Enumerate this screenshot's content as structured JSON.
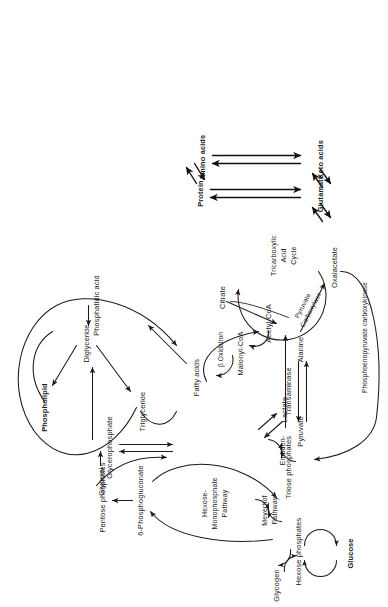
{
  "figure": {
    "domain": "diagram",
    "kind": "metabolic-pathway-map",
    "orientation": "rotated-90-ccw",
    "background_color": "#ffffff",
    "ink_color": "#1a1a1a"
  },
  "nodes": {
    "glucose": "Glucose",
    "glycogen": "Glycogen",
    "hexose_phosphates": "Hexose  phosphates",
    "six_phosphogluconate": "6-Phosphogluconate",
    "pentose_phosphates": "Pentose phosphates",
    "triose_phosphates": "Triose phosphates",
    "glycerol": "Glycerol",
    "glycerophosphate": "Glycerophosphate",
    "lactate": "Lactate",
    "pyruvate": "Pyruvate",
    "alanine": "Alanine",
    "oxalacetate": "Oxalacetate",
    "acetyl_coa": "Acetyl-CoA",
    "malonyl_coa": "Malonyl-CoA",
    "fatty_acids": "Fatty acids",
    "citrate": "Citrate",
    "phosphatidic_acid": "Phosphatidic acid",
    "diglyceride": "Diglyceride",
    "triglyceride": "Triglyceride",
    "phospholipid": "Phospholipid",
    "glutamate": "Glutamate",
    "keto_acids": "Keto acids",
    "protein": "Protein",
    "amino_acids": "Amino acids"
  },
  "cycle_labels": {
    "hexose_monophosphate_l1": "Hexose-",
    "hexose_monophosphate_l2": "Monophosphate",
    "hexose_monophosphate_l3": "Pathway",
    "embden": "Embden-",
    "meyerhof_l1": "Meyerhof",
    "meyerhof_l2": "Pathway",
    "tca_l1": "Tricarboxylic",
    "tca_l2": "Acid",
    "tca_l3": "Cycle"
  },
  "enzyme_labels": {
    "transaminase": "Transaminase",
    "pyruvate_carboxylase_l1": "Pyruvate",
    "pyruvate_carboxylase_l2": "Carboxylase",
    "pepck": "Phosphoenopyruvate carboxykinase",
    "beta_oxidation": "β Oxidation"
  },
  "bold_nodes": [
    "Glucose",
    "Phospholipid",
    "Amino acids",
    "Keto acids"
  ],
  "edges": [
    {
      "from": "Glucose",
      "to": "Hexose  phosphates",
      "type": "reversible-cycle"
    },
    {
      "from": "Hexose  phosphates",
      "to": "Glycogen",
      "type": "reversible-cycle"
    },
    {
      "from": "Hexose  phosphates",
      "to": "6-Phosphogluconate",
      "type": "arrow"
    },
    {
      "from": "6-Phosphogluconate",
      "to": "Pentose phosphates",
      "type": "arrow"
    },
    {
      "from": "Pentose phosphates",
      "to": "Triose phosphates",
      "type": "arrow"
    },
    {
      "from": "Hexose  phosphates",
      "to": "Triose phosphates",
      "type": "reversible-cycle"
    },
    {
      "from": "Triose phosphates",
      "to": "Glycerophosphate",
      "type": "double-arrow"
    },
    {
      "from": "Glycerol",
      "to": "Glycerophosphate",
      "type": "arrow"
    },
    {
      "from": "Glycerophosphate",
      "to": "Phosphatidic acid",
      "type": "arrow"
    },
    {
      "from": "Triose phosphates",
      "to": "Pyruvate",
      "type": "reversible-cycle"
    },
    {
      "from": "Lactate",
      "to": "Pyruvate",
      "type": "double-arrow"
    },
    {
      "from": "Alanine",
      "to": "Pyruvate",
      "type": "double-arrow",
      "enzyme": "Transaminase"
    },
    {
      "from": "Pyruvate",
      "to": "Oxalacetate",
      "type": "arrow",
      "enzyme": "Pyruvate Carboxylase"
    },
    {
      "from": "Pyruvate",
      "to": "Acetyl-CoA",
      "type": "arrow"
    },
    {
      "from": "Oxalacetate",
      "to": "Triose phosphates",
      "type": "arrow",
      "enzyme": "Phosphoenopyruvate carboxykinase"
    },
    {
      "from": "Oxalacetate",
      "to": "Citrate",
      "type": "cycle"
    },
    {
      "from": "Citrate",
      "to": "Acetyl-CoA",
      "type": "arrow"
    },
    {
      "from": "Acetyl-CoA",
      "to": "Malonyl-CoA",
      "type": "arrow"
    },
    {
      "from": "Malonyl-CoA",
      "to": "Fatty acids",
      "type": "arrow"
    },
    {
      "from": "Fatty acids",
      "to": "Acetyl-CoA",
      "type": "arrow",
      "enzyme": "β Oxidation"
    },
    {
      "from": "Fatty acids",
      "to": "Phosphatidic acid",
      "type": "arrow"
    },
    {
      "from": "Phosphatidic acid",
      "to": "Diglyceride",
      "type": "arrow"
    },
    {
      "from": "Diglyceride",
      "to": "Triglyceride",
      "type": "arrow"
    },
    {
      "from": "Diglyceride",
      "to": "Phospholipid",
      "type": "arrow"
    },
    {
      "from": "Triglyceride",
      "to": "Fatty acids",
      "type": "long-arc"
    },
    {
      "from": "Phospholipid",
      "to": "Fatty acids",
      "type": "long-arc"
    },
    {
      "from": "Tricarboxylic Acid Cycle",
      "to": "Glutamate",
      "type": "double-arrow"
    },
    {
      "from": "Glutamate",
      "to": "Keto acids",
      "type": "double-arrow"
    },
    {
      "from": "Glutamate",
      "to": "Protein",
      "type": "double-arrow"
    },
    {
      "from": "Keto acids",
      "to": "Amino acids",
      "type": "double-arrow"
    },
    {
      "from": "Protein",
      "to": "Amino acids",
      "type": "double-arrow"
    }
  ]
}
